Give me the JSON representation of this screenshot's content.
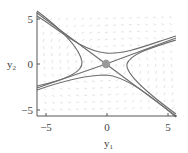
{
  "chart_data": {
    "type": "line",
    "subtype": "phase_portrait",
    "title": "",
    "xlabel": "y1",
    "ylabel": "y2",
    "xlabel_main": "y",
    "xlabel_sub": "1",
    "ylabel_main": "y",
    "ylabel_sub": "2",
    "xlim": [
      -5.7,
      5.7
    ],
    "ylim": [
      -5.6,
      6.2
    ],
    "x_ticks": [
      -5,
      0,
      5
    ],
    "y_ticks": [
      -5,
      0,
      5
    ],
    "x_tick_labels": [
      "−5",
      "0",
      "5"
    ],
    "y_tick_labels": [
      "−5",
      "0",
      "5"
    ],
    "grid": false,
    "legend": null,
    "equilibrium": {
      "x": 0,
      "y": 0,
      "kind": "saddle",
      "color": "#999999"
    },
    "vector_field": {
      "present": true,
      "color": "#d0d0d0"
    },
    "series": [
      {
        "name": "separatrix-a",
        "description": "line through origin, upper-left to lower-right",
        "points": [
          [
            -5.7,
            6.0
          ],
          [
            0,
            0
          ],
          [
            5.7,
            -5.6
          ]
        ]
      },
      {
        "name": "separatrix-b",
        "description": "line through origin, lower-left to upper-right",
        "points": [
          [
            -5.7,
            -2.6
          ],
          [
            0,
            0
          ],
          [
            5.7,
            2.8
          ]
        ]
      },
      {
        "name": "trajectory-top",
        "description": "hyperbola branch above saddle",
        "points": [
          [
            -5.7,
            5.6
          ],
          [
            -2,
            2.4
          ],
          [
            0,
            1.2
          ],
          [
            2,
            1.5
          ],
          [
            5.7,
            2.9
          ]
        ]
      },
      {
        "name": "trajectory-bottom",
        "description": "hyperbola branch below saddle",
        "points": [
          [
            -5.7,
            -2.7
          ],
          [
            -2,
            -1.4
          ],
          [
            0,
            -1.2
          ],
          [
            2,
            -2.2
          ],
          [
            5.7,
            -5.6
          ]
        ]
      },
      {
        "name": "trajectory-left",
        "description": "hyperbola branch left of saddle",
        "points": [
          [
            -5.7,
            5.9
          ],
          [
            -2.2,
            0.3
          ],
          [
            -2.0,
            0
          ],
          [
            -2.4,
            -0.9
          ],
          [
            -5.7,
            -2.6
          ]
        ]
      },
      {
        "name": "trajectory-right",
        "description": "hyperbola branch right of saddle",
        "points": [
          [
            5.7,
            2.7
          ],
          [
            2.0,
            0.6
          ],
          [
            1.7,
            0
          ],
          [
            2.2,
            -1.4
          ],
          [
            5.7,
            -5.5
          ]
        ]
      }
    ],
    "colors": {
      "curves": "#6e6e6e",
      "axes": "#555555",
      "text": "#444444",
      "field": "#cfcfcf"
    }
  }
}
